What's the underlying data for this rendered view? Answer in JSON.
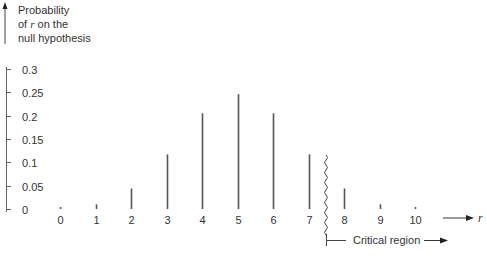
{
  "chart_data": {
    "type": "bar",
    "title": "",
    "ylabel": "Probability of r on the null hypothesis",
    "ylabel_lines": [
      "Probability",
      "of",
      "r",
      "on the",
      "null hypothesis"
    ],
    "xlabel": "r",
    "categories": [
      "0",
      "1",
      "2",
      "3",
      "4",
      "5",
      "6",
      "7",
      "8",
      "9",
      "10"
    ],
    "values": [
      0.001,
      0.01,
      0.044,
      0.117,
      0.205,
      0.246,
      0.205,
      0.117,
      0.044,
      0.01,
      0.001
    ],
    "ylim": [
      0,
      0.3
    ],
    "yticks": [
      "0",
      "0.05",
      "0.1",
      "0.15",
      "0.2",
      "0.25",
      "0.3"
    ],
    "grid": false,
    "legend": null,
    "annotations": [
      {
        "text": "Critical region",
        "from_r": 8,
        "direction": "right",
        "boundary": "wavy line between 7 and 8"
      }
    ]
  },
  "axis": {
    "y_line1": "Probability",
    "y_line2_pre": "of ",
    "y_line2_var": "r",
    "y_line2_post": " on the",
    "y_line3": "null hypothesis",
    "x_var": "r",
    "critical_label": "Critical region"
  },
  "colors": {
    "bar": "#555555",
    "text": "#333333",
    "axis": "#555555"
  }
}
